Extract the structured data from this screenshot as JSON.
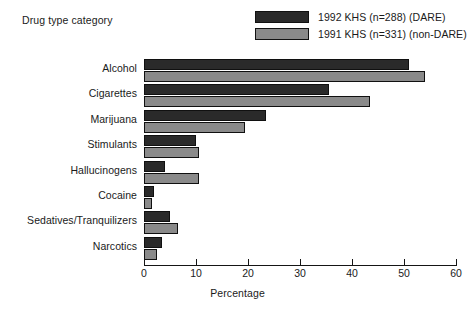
{
  "chart_data": {
    "type": "bar",
    "orientation": "horizontal",
    "title": "",
    "xlabel": "Percentage",
    "ylabel": "Drug type category",
    "xlim": [
      0,
      60
    ],
    "xticks": [
      0,
      10,
      20,
      30,
      40,
      50,
      60
    ],
    "grid": false,
    "legend_position": "top-right",
    "categories": [
      "Alcohol",
      "Cigarettes",
      "Marijuana",
      "Stimulants",
      "Hallucinogens",
      "Cocaine",
      "Sedatives/Tranquilizers",
      "Narcotics"
    ],
    "series": [
      {
        "name": "1992 KHS (n=288) (DARE)",
        "color": "#2a2a2a",
        "values": [
          51,
          35.5,
          23.5,
          10,
          4,
          2,
          5,
          3.5
        ]
      },
      {
        "name": "1991 KHS (n=331) (non-DARE)",
        "color": "#8a8a8a",
        "values": [
          54,
          43.5,
          19.5,
          10.5,
          10.5,
          1.5,
          6.5,
          2.5
        ]
      }
    ]
  },
  "colors": {
    "series_dark": "#2a2a2a",
    "series_gray": "#8a8a8a",
    "axis": "#151515",
    "text": "#1a1a1a",
    "background": "#ffffff"
  }
}
